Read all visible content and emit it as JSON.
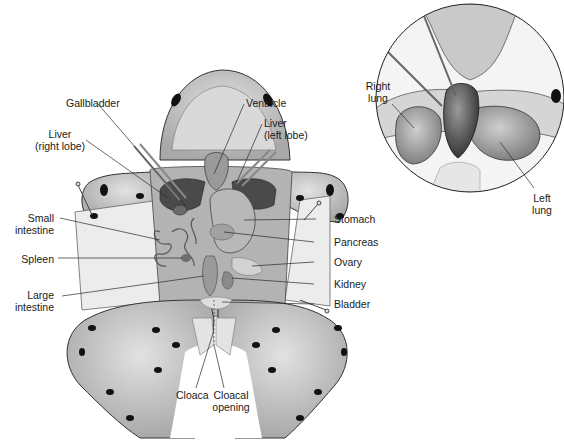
{
  "diagram": {
    "colors": {
      "skin": "#cfcfcf",
      "skin_dark": "#9a9a9a",
      "spots": "#111111",
      "organ_dark": "#3d3d3d",
      "organ_mid": "#8a8a8a",
      "organ_light": "#bdbdbd",
      "flap": "#ececec",
      "leader": "#2a2a2a"
    },
    "main_labels": {
      "gallbladder": "Gallbladder",
      "ventricle": "Ventricle",
      "liver_right": "Liver\n(right lobe)",
      "liver_left": "Liver\n(left lobe)",
      "small_intestine": "Small\nintestine",
      "spleen": "Spleen",
      "large_intestine": "Large\nintestine",
      "stomach": "Stomach",
      "pancreas": "Pancreas",
      "ovary": "Ovary",
      "kidney": "Kidney",
      "bladder": "Bladder",
      "cloaca": "Cloaca",
      "cloacal_opening": "Cloacal\nopening"
    },
    "inset": {
      "title": "Lung detail (circular inset)",
      "labels": {
        "right_lung": "Right\nlung",
        "left_lung": "Left\nlung"
      }
    }
  }
}
